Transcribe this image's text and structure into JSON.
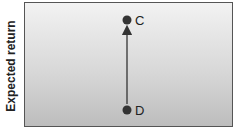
{
  "diagram": {
    "y_axis_label": "Expected return",
    "points": [
      {
        "id": "C",
        "label": "C",
        "x": 127,
        "y": 20
      },
      {
        "id": "D",
        "label": "D",
        "x": 127,
        "y": 110
      }
    ],
    "arrow": {
      "from": "D",
      "to": "C"
    },
    "colors": {
      "point": "#333333",
      "arrow": "#333333",
      "border": "#555555"
    }
  }
}
